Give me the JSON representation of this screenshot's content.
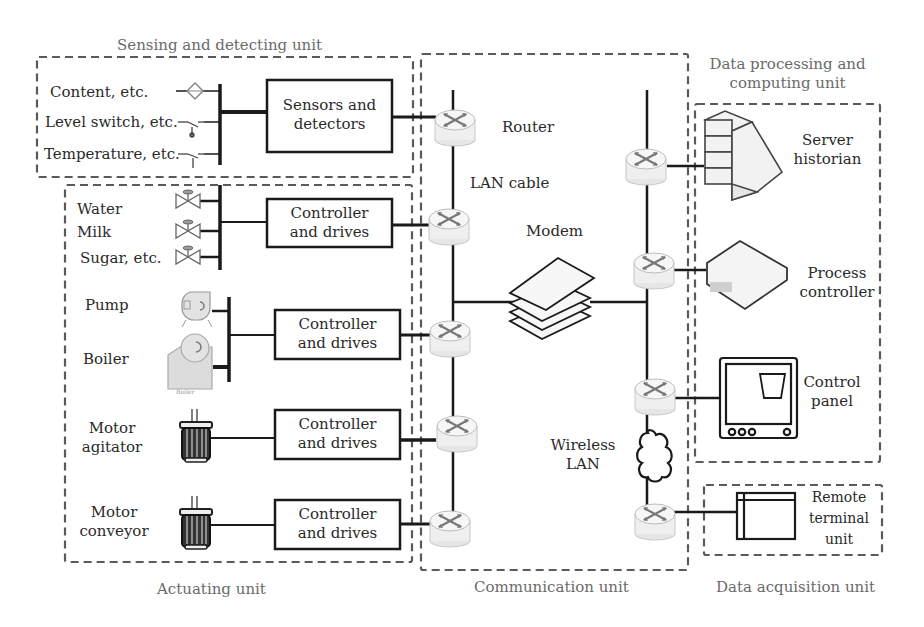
{
  "diagram": {
    "units": {
      "sensing": {
        "title": "Sensing and detecting unit"
      },
      "actuating": {
        "title": "Actuating unit"
      },
      "communication": {
        "title": "Communication unit"
      },
      "data_processing": {
        "title_line1": "Data processing and",
        "title_line2": "computing unit"
      },
      "data_acquisition": {
        "title": "Data acquisition unit"
      }
    },
    "sensing_inputs": [
      {
        "label": "Content, etc.",
        "icon": "diamond-sensor-icon"
      },
      {
        "label": "Level switch, etc.",
        "icon": "level-switch-icon"
      },
      {
        "label": "Temperature, etc.",
        "icon": "temperature-probe-icon"
      }
    ],
    "sensors_box": {
      "line1": "Sensors and",
      "line2": "detectors"
    },
    "actuators": {
      "valves": [
        "Water",
        "Milk",
        "Sugar, etc."
      ],
      "pump": "Pump",
      "boiler": "Boiler",
      "boiler_caption": "Boiler",
      "motor_agitator": {
        "line1": "Motor",
        "line2": "agitator"
      },
      "motor_conveyor": {
        "line1": "Motor",
        "line2": "conveyor"
      }
    },
    "controller_box": {
      "line1": "Controller",
      "line2": "and drives"
    },
    "communication": {
      "router": "Router",
      "lan_cable": "LAN cable",
      "modem": "Modem",
      "wireless_line1": "Wireless",
      "wireless_line2": "LAN"
    },
    "data_processing": {
      "server": {
        "line1": "Server",
        "line2": "historian"
      },
      "process_controller": {
        "line1": "Process",
        "line2": "controller"
      },
      "control_panel": {
        "line1": "Control",
        "line2": "panel"
      }
    },
    "data_acquisition": {
      "rtu": {
        "line1": "Remote",
        "line2": "terminal",
        "line3": "unit"
      }
    },
    "colors": {
      "line": "#1a1a1a",
      "dash": "#555555",
      "router_fill": "#eeeeee",
      "device_fill": "#f2f2f2",
      "unit_title": "#6a6a6a"
    }
  }
}
